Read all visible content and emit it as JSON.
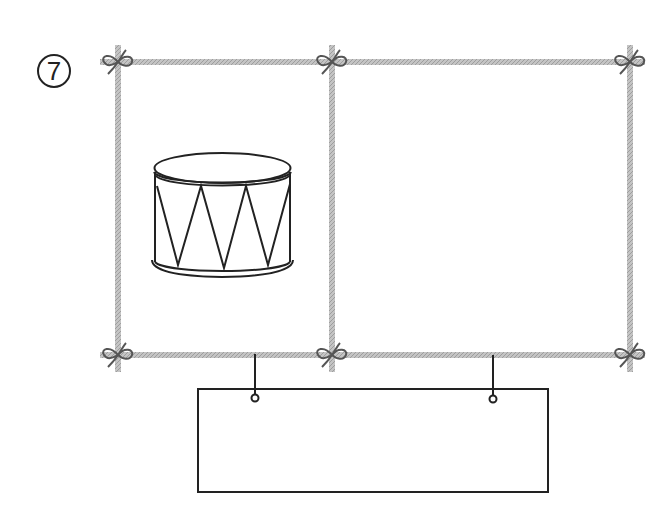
{
  "problem": {
    "number_label": "⑦",
    "number_text": "7"
  },
  "frames": [
    {
      "id": "left",
      "content": "drum-illustration"
    },
    {
      "id": "right",
      "content": "empty"
    }
  ],
  "answer_box": {
    "value": "",
    "hangers": 2
  },
  "colors": {
    "rope": "#b4b4b4",
    "knot": "#555555",
    "ink": "#222222"
  }
}
